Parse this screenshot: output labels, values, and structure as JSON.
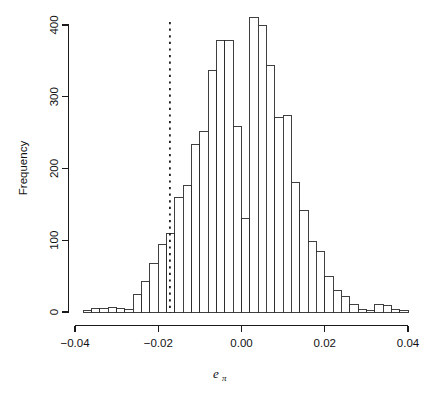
{
  "chart_data": {
    "type": "bar",
    "title": "",
    "subtitle": "",
    "xlabel": "e_pi",
    "xlabel_base": "e",
    "xlabel_subscript": "π",
    "ylabel": "Frequency",
    "xlim": [
      -0.04,
      0.04
    ],
    "ylim": [
      0,
      420
    ],
    "grid": false,
    "legend": null,
    "bin_width": 0.002,
    "x_ticks": [
      -0.04,
      -0.02,
      0.0,
      0.02,
      0.04
    ],
    "x_tick_labels": [
      "-0.04",
      "-0.02",
      "0.00",
      "0.02",
      "0.04"
    ],
    "y_ticks": [
      0,
      100,
      200,
      300,
      400
    ],
    "y_tick_labels": [
      "0",
      "100",
      "200",
      "300",
      "400"
    ],
    "bin_edges": [
      -0.038,
      -0.036,
      -0.034,
      -0.032,
      -0.03,
      -0.028,
      -0.026,
      -0.024,
      -0.022,
      -0.02,
      -0.018,
      -0.016,
      -0.014,
      -0.012,
      -0.01,
      -0.008,
      -0.006,
      -0.004,
      -0.002,
      0.0,
      0.002,
      0.004,
      0.006,
      0.008,
      0.01,
      0.012,
      0.014,
      0.016,
      0.018,
      0.02,
      0.022,
      0.024,
      0.026,
      0.028,
      0.03,
      0.032,
      0.034,
      0.036,
      0.038,
      0.04
    ],
    "categories": [
      "-0.0370",
      "-0.0350",
      "-0.0330",
      "-0.0310",
      "-0.0290",
      "-0.0270",
      "-0.0250",
      "-0.0230",
      "-0.0210",
      "-0.0190",
      "-0.0170",
      "-0.0150",
      "-0.0130",
      "-0.0110",
      "-0.0090",
      "-0.0070",
      "-0.0050",
      "-0.0030",
      "-0.0010",
      "0.0010",
      "0.0030",
      "0.0050",
      "0.0070",
      "0.0090",
      "0.0110",
      "0.0130",
      "0.0150",
      "0.0170",
      "0.0190",
      "0.0210",
      "0.0230",
      "0.0250",
      "0.0270",
      "0.0290",
      "0.0310",
      "0.0330",
      "0.0350",
      "0.0370",
      "0.0390"
    ],
    "values": [
      2,
      5,
      5,
      6,
      5,
      3,
      25,
      43,
      68,
      94,
      109,
      159,
      177,
      233,
      252,
      337,
      379,
      379,
      258,
      130,
      410,
      400,
      343,
      271,
      274,
      181,
      142,
      98,
      84,
      49,
      30,
      22,
      11,
      3,
      2,
      10,
      9,
      3,
      2
    ],
    "annotations": [
      {
        "type": "vertical-line",
        "name": "reference-line",
        "x": -0.0172,
        "style": "dotted",
        "label": ""
      }
    ]
  },
  "axes": {
    "y_axis_title": "Frequency",
    "x_axis_title_base": "e",
    "x_axis_title_sub": "π"
  },
  "colors": {
    "bar_stroke": "#2b2b2b",
    "bar_fill": "#ffffff",
    "axis": "#1a1a1a",
    "reference_line": "#111111",
    "background": "#ffffff"
  }
}
